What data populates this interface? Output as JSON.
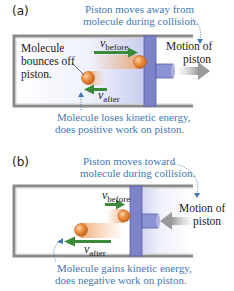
{
  "panels": [
    {
      "label": "(a)",
      "top_caption_line1": "Piston moves away from",
      "top_caption_line2": "molecule during collision.",
      "left_note_line1": "Molecule",
      "left_note_line2": "bounces off",
      "left_note_line3": "piston.",
      "v_before_symbol": "v",
      "v_before_sub": "before",
      "v_after_symbol": "v",
      "v_after_sub": "after",
      "motion_line1": "Motion of",
      "motion_line2": "piston",
      "bottom_caption_line1": "Molecule loses kinetic energy,",
      "bottom_caption_line2": "does positive work on piston."
    },
    {
      "label": "(b)",
      "top_caption_line1": "Piston moves toward",
      "top_caption_line2": "molecule during collision.",
      "v_before_symbol": "v",
      "v_before_sub": "before",
      "v_after_symbol": "v",
      "v_after_sub": "after",
      "motion_line1": "Motion of",
      "motion_line2": "piston",
      "bottom_caption_line1": "Molecule gains kinetic energy,",
      "bottom_caption_line2": "does negative work on piston."
    }
  ],
  "colors": {
    "caption_blue": "#3f79b5",
    "velocity_green": "#3a8a3a",
    "piston_blue": "#7c83c9",
    "cylinder_gray": "#8a8a8a",
    "molecule_orange": "#e8893a",
    "motion_arrow_gray": "#a0a0a0"
  }
}
